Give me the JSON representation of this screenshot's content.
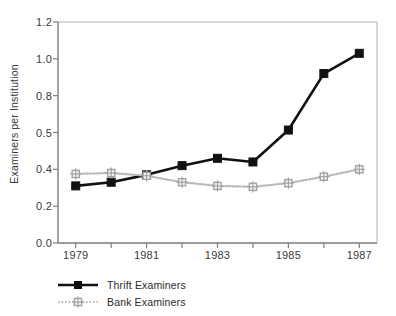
{
  "figure": {
    "title_remnant": "",
    "background": "#ffffff"
  },
  "axes": {
    "ylabel": "Examiners per Institution",
    "xlabel": "",
    "ytick_labels": [
      "0.0",
      "0.2",
      "0.4",
      "0.5",
      "0.8",
      "1.0",
      "1.2"
    ],
    "xtick_labels": [
      "1979",
      "1981",
      "1983",
      "1985",
      "1987"
    ]
  },
  "legend": {
    "items": [
      {
        "label": "Thrift Examiners",
        "color": "#111111",
        "style": "solid-square"
      },
      {
        "label": "Bank Examiners",
        "color": "#b9b9b9",
        "style": "dotted-square"
      }
    ]
  },
  "chart_data": {
    "type": "line",
    "title": "",
    "xlabel": "",
    "ylabel": "Examiners per Institution",
    "x": [
      1979,
      1980,
      1981,
      1982,
      1983,
      1984,
      1985,
      1986,
      1987
    ],
    "xtick_values": [
      1979,
      1981,
      1983,
      1985,
      1987
    ],
    "xtick_labels": [
      "1979",
      "1981",
      "1983",
      "1985",
      "1987"
    ],
    "xlim": [
      1978.5,
      1987.5
    ],
    "ytick_labels": [
      "0.0",
      "0.2",
      "0.4",
      "0.5",
      "0.8",
      "1.0",
      "1.2"
    ],
    "ytick_positions": [
      0,
      1,
      2,
      3,
      4,
      5,
      6
    ],
    "ylim": [
      0.0,
      1.2
    ],
    "grid": false,
    "legend_position": "below-left",
    "series": [
      {
        "name": "Thrift Examiners",
        "color": "#111111",
        "marker": "square",
        "linestyle": "solid",
        "values": [
          0.31,
          0.33,
          0.37,
          0.41,
          0.43,
          0.42,
          0.52,
          0.92,
          1.03
        ]
      },
      {
        "name": "Bank Examiners",
        "color": "#b9b9b9",
        "marker": "square-open",
        "linestyle": "dotted",
        "values": [
          0.375,
          0.38,
          0.365,
          0.33,
          0.31,
          0.305,
          0.325,
          0.36,
          0.4
        ]
      }
    ]
  }
}
